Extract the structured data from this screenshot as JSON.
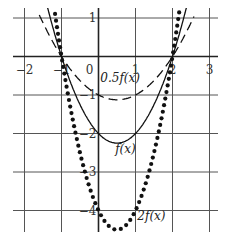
{
  "chart_data": {
    "type": "line",
    "title": "",
    "xlabel": "",
    "ylabel": "",
    "xlim": [
      -2.3,
      3.2
    ],
    "ylim": [
      -4.6,
      1.1
    ],
    "grid": true,
    "legend": "none",
    "x_ticks": [
      "-2",
      "-1",
      "0",
      "1",
      "2",
      "3"
    ],
    "y_ticks": [
      "1",
      "-1",
      "-2",
      "-3",
      "-4"
    ],
    "x_tick_values": [
      -2,
      -1,
      0,
      1,
      2,
      3
    ],
    "y_tick_values": [
      1,
      -1,
      -2,
      -3,
      -4
    ],
    "series": [
      {
        "name": "f(x)",
        "style": "solid",
        "formula": "x^2 - x - 2",
        "roots": [
          -1,
          2
        ],
        "vertex": [
          0.5,
          -2.25
        ],
        "y_intercept": -2
      },
      {
        "name": "0.5f(x)",
        "style": "dashed",
        "formula": "0.5(x^2 - x - 2)",
        "roots": [
          -1,
          2
        ],
        "vertex": [
          0.5,
          -1.125
        ],
        "y_intercept": -1
      },
      {
        "name": "2f(x)",
        "style": "dotted",
        "formula": "2(x^2 - x - 2)",
        "roots": [
          -1,
          2
        ],
        "vertex": [
          0.5,
          -4.5
        ],
        "y_intercept": -4
      }
    ],
    "annotations": [
      {
        "text": "0.5f(x)",
        "x": 0.05,
        "y": -0.65
      },
      {
        "text": "f(x)",
        "x": 0.45,
        "y": -2.5
      },
      {
        "text": "2f(x)",
        "x": 1.05,
        "y": -4.25
      }
    ]
  }
}
